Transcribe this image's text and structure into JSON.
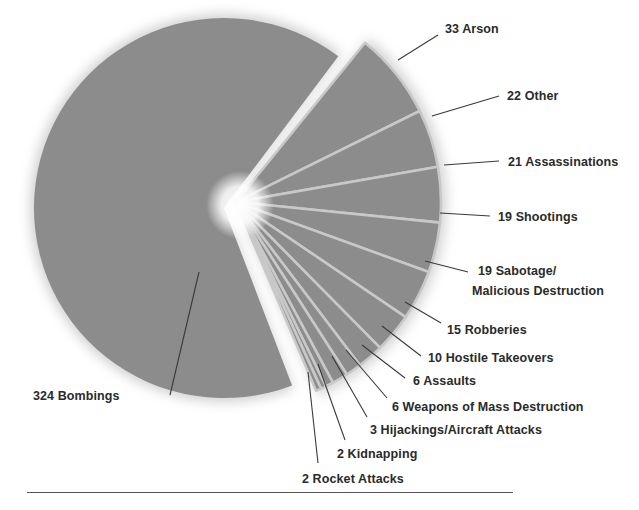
{
  "chart_data": {
    "type": "pie",
    "title": "",
    "total": 482,
    "slice_color": "#8c8c8c",
    "gap_color": "#c8c8c8",
    "exploded_main": {
      "label": "Bombings",
      "value": 324
    },
    "slices": [
      {
        "label": "Bombings",
        "value": 324,
        "text": "324 Bombings"
      },
      {
        "label": "Arson",
        "value": 33,
        "text": "33 Arson"
      },
      {
        "label": "Other",
        "value": 22,
        "text": "22 Other"
      },
      {
        "label": "Assassinations",
        "value": 21,
        "text": "21 Assassinations"
      },
      {
        "label": "Shootings",
        "value": 19,
        "text": "19 Shootings"
      },
      {
        "label": "Sabotage/Malicious Destruction",
        "value": 19,
        "text": "19 Sabotage/",
        "text2": "Malicious Destruction"
      },
      {
        "label": "Robberies",
        "value": 15,
        "text": "15 Robberies"
      },
      {
        "label": "Hostile Takeovers",
        "value": 10,
        "text": "10 Hostile Takeovers"
      },
      {
        "label": "Assaults",
        "value": 6,
        "text": "6 Assaults"
      },
      {
        "label": "Weapons of Mass Destruction",
        "value": 6,
        "text": "6 Weapons of Mass Destruction"
      },
      {
        "label": "Hijackings/Aircraft Attacks",
        "value": 3,
        "text": "3 Hijackings/Aircraft Attacks"
      },
      {
        "label": "Kidnapping",
        "value": 2,
        "text": "2 Kidnapping"
      },
      {
        "label": "Rocket Attacks",
        "value": 2,
        "text": "2 Rocket Attacks"
      }
    ],
    "legend": "none (direct labels with leader lines)"
  }
}
